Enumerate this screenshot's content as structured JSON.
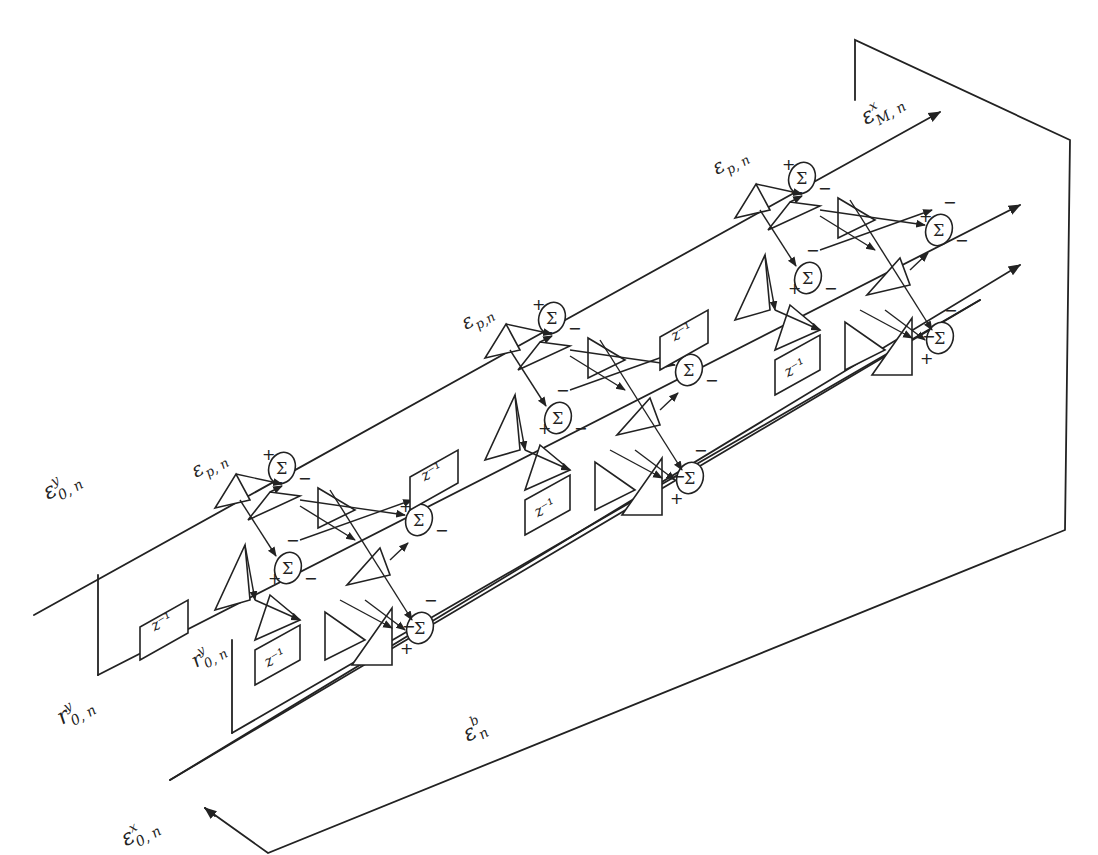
{
  "diagram": {
    "type": "lattice-filter-signal-flow",
    "colors": {
      "line": "#222222",
      "background": "#ffffff"
    },
    "labels": {
      "input_forward_y": {
        "base": "ε",
        "sup": "y",
        "sub": "0, n",
        "x": 48,
        "y": 500
      },
      "input_backward_y": {
        "base": "r",
        "sup": "y",
        "sub": "0, n",
        "x": 62,
        "y": 725
      },
      "input_forward_x": {
        "base": "ε",
        "sup": "x",
        "sub": "0, n",
        "x": 226,
        "y": 830
      },
      "backward_error": {
        "base": "ε",
        "sup": "b",
        "sub": "n",
        "x": 468,
        "y": 742
      },
      "output_forward_x": {
        "base": "ε",
        "sup": "x",
        "sub": "M, n",
        "x": 866,
        "y": 125
      },
      "inner_backward_y": {
        "base": "r",
        "sup": "y",
        "sub": "0, n",
        "x": 196,
        "y": 668
      },
      "stage_labels": [
        {
          "base": "ε",
          "sub": "p, n",
          "x": 196,
          "y": 478
        },
        {
          "base": "ε",
          "sub": "p,n",
          "x": 466,
          "y": 330
        },
        {
          "base": "ε",
          "sub": "p, n",
          "x": 717,
          "y": 175
        }
      ]
    },
    "delay_label": "z⁻¹",
    "sigma_label": "Σ",
    "signs": {
      "plus": "+",
      "minus": "−"
    },
    "stages": [
      {
        "name": "stage-1",
        "ox": 0,
        "oy": 0
      },
      {
        "name": "stage-2",
        "ox": 270,
        "oy": -150
      },
      {
        "name": "stage-3",
        "ox": 520,
        "oy": -290
      }
    ]
  }
}
